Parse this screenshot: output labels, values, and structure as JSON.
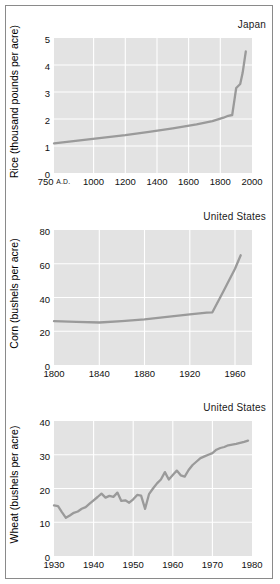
{
  "figure": {
    "background": "#ffffff",
    "border_color": "#8a8a8a",
    "plot_background": "#e3e3e3",
    "grid_color": "#ffffff",
    "line_color": "#9a9a9a"
  },
  "chart_data": [
    {
      "type": "line",
      "id": "rice-japan",
      "title": "",
      "annotation": "Japan",
      "xlabel": "",
      "ylabel": "Rice (thousand pounds per acre)",
      "xlim": [
        750,
        2000
      ],
      "ylim": [
        0,
        5
      ],
      "xticks": [
        750,
        1000,
        1200,
        1400,
        1600,
        1800,
        2000
      ],
      "xticklabels": [
        "750 A.D.",
        "1000",
        "1200",
        "1400",
        "1600",
        "1800",
        "2000"
      ],
      "yticks": [
        0,
        1,
        2,
        3,
        4,
        5
      ],
      "yticklabels": [
        "0",
        "1",
        "2",
        "3",
        "4",
        "5"
      ],
      "grid": true,
      "legend": "none",
      "x": [
        750,
        900,
        1050,
        1200,
        1350,
        1500,
        1650,
        1750,
        1820,
        1850,
        1875,
        1890,
        1900,
        1925,
        1940,
        1955,
        1960
      ],
      "y": [
        1.1,
        1.2,
        1.3,
        1.4,
        1.52,
        1.65,
        1.8,
        1.92,
        2.05,
        2.12,
        2.15,
        2.75,
        3.15,
        3.3,
        3.7,
        4.3,
        4.5
      ]
    },
    {
      "type": "line",
      "id": "corn-us",
      "title": "",
      "annotation": "United States",
      "xlabel": "",
      "ylabel": "Corn (bushels per acre)",
      "xlim": [
        1800,
        1975
      ],
      "ylim": [
        0,
        80
      ],
      "xticks": [
        1800,
        1840,
        1880,
        1920,
        1960
      ],
      "xticklabels": [
        "1800",
        "1840",
        "1880",
        "1920",
        "1960"
      ],
      "yticks": [
        0,
        20,
        40,
        60,
        80
      ],
      "yticklabels": [
        "0",
        "20",
        "40",
        "60",
        "80"
      ],
      "grid": true,
      "legend": "none",
      "x": [
        1800,
        1820,
        1840,
        1860,
        1880,
        1900,
        1920,
        1935,
        1940,
        1950,
        1960,
        1965
      ],
      "y": [
        26.0,
        25.6,
        25.2,
        26.0,
        27.0,
        28.5,
        30.0,
        31.0,
        31.2,
        44.0,
        57.0,
        65.0
      ]
    },
    {
      "type": "line",
      "id": "wheat-us",
      "title": "",
      "annotation": "United States",
      "xlabel": "",
      "ylabel": "Wheat (bushels per acre)",
      "xlim": [
        1930,
        1980
      ],
      "ylim": [
        0,
        40
      ],
      "xticks": [
        1930,
        1940,
        1950,
        1960,
        1970,
        1980
      ],
      "xticklabels": [
        "1930",
        "1940",
        "1950",
        "1960",
        "1970",
        "1980"
      ],
      "yticks": [
        0,
        10,
        20,
        30,
        40
      ],
      "yticklabels": [
        "0",
        "10",
        "20",
        "30",
        "40"
      ],
      "grid": true,
      "legend": "none",
      "x": [
        1930,
        1931,
        1932,
        1933,
        1934,
        1935,
        1936,
        1937,
        1938,
        1939,
        1940,
        1941,
        1942,
        1943,
        1944,
        1945,
        1946,
        1947,
        1948,
        1949,
        1950,
        1951,
        1952,
        1953,
        1954,
        1955,
        1956,
        1957,
        1958,
        1959,
        1960,
        1961,
        1962,
        1963,
        1964,
        1965,
        1966,
        1967,
        1968,
        1969,
        1970,
        1971,
        1972,
        1973,
        1974,
        1975,
        1976,
        1977,
        1978,
        1979
      ],
      "y": [
        15.0,
        14.8,
        13.0,
        11.3,
        12.0,
        12.8,
        13.2,
        14.0,
        14.5,
        15.5,
        16.5,
        17.5,
        18.5,
        17.3,
        17.8,
        17.5,
        18.8,
        16.3,
        16.5,
        15.8,
        16.8,
        17.3,
        17.0,
        14.0,
        18.3,
        20.0,
        21.5,
        22.8,
        25.0,
        23.0,
        24.0,
        25.3,
        23.9,
        23.5,
        25.5,
        27.0,
        28.0,
        29.0,
        29.5,
        30.0,
        30.5,
        31.5,
        32.0,
        32.3,
        32.8,
        33.0,
        33.2,
        33.5,
        33.8,
        34.2
      ]
    }
  ]
}
